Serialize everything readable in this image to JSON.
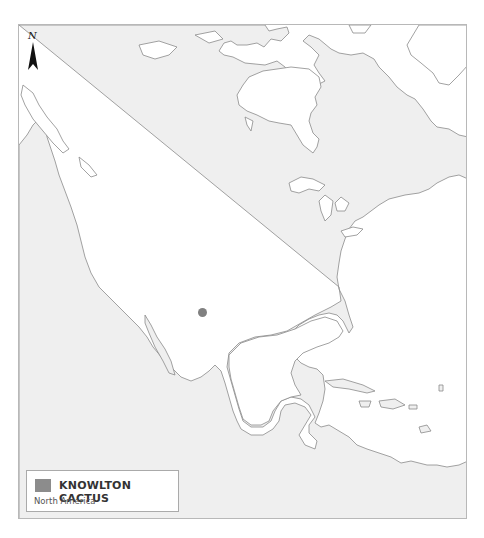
{
  "map": {
    "region": "North America",
    "land_color": "#efefef",
    "water_color": "#ffffff",
    "coast_color": "#8a8a8a"
  },
  "north_arrow": {
    "label": "N"
  },
  "legend": {
    "title": "KNOWLTON CACTUS",
    "subtitle": "North America",
    "swatch_color": "#8c8c8c"
  },
  "occurrences": [
    {
      "x": 184,
      "y": 288,
      "r": 4.5,
      "color": "#808080"
    }
  ]
}
